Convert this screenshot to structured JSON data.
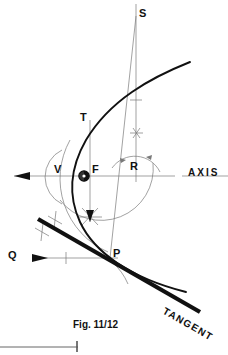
{
  "figure": {
    "caption": "Fig. 11/12",
    "stroke_color": "#111111",
    "construction_color": "#666666",
    "background": "#ffffff"
  },
  "labels": {
    "focus": "F",
    "vertex": "V",
    "point_s": "S",
    "point_t": "T",
    "point_r": "R",
    "point_p": "P",
    "point_q": "Q",
    "axis": "AXIS",
    "tangent": "TANGENT"
  },
  "geometry": {
    "axis_y": 176,
    "focus": {
      "x": 84,
      "y": 176
    },
    "vertex": {
      "x": 62,
      "y": 176
    },
    "directrix_x": 136,
    "point_t": {
      "x": 90,
      "y": 120
    },
    "point_s": {
      "x": 136,
      "y": 16
    },
    "point_r": {
      "x": 136,
      "y": 176
    },
    "point_p": {
      "x": 110,
      "y": 258
    },
    "point_q": {
      "x": 22,
      "y": 258
    },
    "parabola_upper_end": {
      "x": 190,
      "y": 62
    },
    "parabola_lower_end": {
      "x": 186,
      "y": 292
    },
    "tangent_start": {
      "x": 38,
      "y": 219
    },
    "tangent_end": {
      "x": 200,
      "y": 312
    },
    "tangent_angle_deg": 29.8
  },
  "marks": {
    "arrow_axis_left": true,
    "arrow_q_right": true,
    "arrow_vertical_down": true,
    "tick_count_directrix": 2,
    "tick_count_tangent": 2,
    "tick_count_q_ray": 1,
    "arc_sweep_present": true
  }
}
